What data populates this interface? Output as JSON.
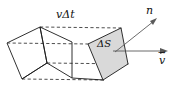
{
  "figure": {
    "name": "flux-through-surface-diagram",
    "labels": {
      "swept_length": {
        "symbol_v": "v",
        "symbol_delta_t": "Δt",
        "full": "vΔt"
      },
      "area_element": {
        "full": "ΔS",
        "delta": "Δ",
        "symbol": "S"
      },
      "normal_unit_vector": {
        "base": "n",
        "accent": "ˆ",
        "full": "n̂"
      },
      "velocity_vector": {
        "base": "v",
        "accent": "→",
        "full": "v⃗"
      }
    },
    "colors": {
      "face_fill": "#d9d9d9",
      "edge_stroke": "#1a1a1a",
      "dashed_stroke": "#3a3a3a",
      "vector_stroke": "#5a5a5a",
      "background": "#ffffff",
      "text": "#111111"
    },
    "geometry": {
      "back_face_points": "7,43 40,27 47,63 22,79",
      "front_face_points": "88,44 121,28 128,64 103,80",
      "shaded_face_points": "88,44 121,28 128,64 103,80",
      "top_connector": {
        "x1": 40,
        "y1": 27,
        "x2": 121,
        "y2": 28
      },
      "mid_connector": {
        "x1": 7,
        "y1": 43,
        "x2": 88,
        "y2": 44
      },
      "lower_connector": {
        "x1": 47,
        "y1": 63,
        "x2": 128,
        "y2": 64
      },
      "bottom_connector": {
        "x1": 22,
        "y1": 79,
        "x2": 103,
        "y2": 80
      },
      "normal_arrow": {
        "x1": 115,
        "y1": 52,
        "x2": 156,
        "y2": 19
      },
      "velocity_arrow": {
        "x1": 113,
        "y1": 51,
        "x2": 167,
        "y2": 51
      }
    }
  }
}
